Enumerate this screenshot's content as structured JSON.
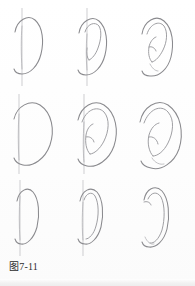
{
  "figure": {
    "caption": "图7-11",
    "kind": "instructional-drawing-grid",
    "medium": "pencil line drawing",
    "background_color": "#fefefe",
    "line_color": "#8a8a8e",
    "guide_color": "#b9b9bd",
    "caption_color": "#2b2b2b",
    "grid": {
      "rows": 3,
      "columns": 3,
      "cell_count": 9
    },
    "rows": [
      {
        "row_label": "row-1",
        "view": "ear viewed nearly straight on, narrow",
        "cells": [
          {
            "index": 1,
            "step_label": "step-1",
            "description": "outer helix outline only, with vertical construction guideline",
            "has_guideline": true,
            "has_inner_detail": false,
            "has_lobe": true
          },
          {
            "index": 2,
            "step_label": "step-2",
            "description": "helix outline plus antihelix curve blocked in, guideline still visible",
            "has_guideline": true,
            "has_inner_detail": true,
            "has_lobe": true
          },
          {
            "index": 3,
            "step_label": "step-3",
            "description": "finished ear with helix, antihelix, concha, tragus and lobe; guideline erased",
            "has_guideline": false,
            "has_inner_detail": true,
            "has_lobe": true
          }
        ]
      },
      {
        "row_label": "row-2",
        "view": "ear viewed from three-quarters, wide and rounded",
        "cells": [
          {
            "index": 4,
            "step_label": "step-1",
            "description": "broad outer helix outline only, with vertical construction guideline",
            "has_guideline": true,
            "has_inner_detail": false,
            "has_lobe": true
          },
          {
            "index": 5,
            "step_label": "step-2",
            "description": "broad helix with antihelix and concha blocked in, guideline still visible",
            "has_guideline": true,
            "has_inner_detail": true,
            "has_lobe": true
          },
          {
            "index": 6,
            "step_label": "step-3",
            "description": "finished wide ear with helix, antihelix, concha, tragus and lobe; guideline erased",
            "has_guideline": false,
            "has_inner_detail": true,
            "has_lobe": true
          }
        ]
      },
      {
        "row_label": "row-3",
        "view": "ear viewed edge-on, very narrow",
        "cells": [
          {
            "index": 7,
            "step_label": "step-1",
            "description": "narrow outer helix outline only, with vertical construction guideline",
            "has_guideline": true,
            "has_inner_detail": false,
            "has_lobe": true
          },
          {
            "index": 8,
            "step_label": "step-2",
            "description": "narrow helix with thin inner rim drawn, guideline still visible",
            "has_guideline": true,
            "has_inner_detail": true,
            "has_lobe": true
          },
          {
            "index": 9,
            "step_label": "step-3",
            "description": "finished narrow edge-on ear with rolled helix rim and small lobe; guideline erased",
            "has_guideline": false,
            "has_inner_detail": true,
            "has_lobe": true
          }
        ]
      }
    ]
  }
}
